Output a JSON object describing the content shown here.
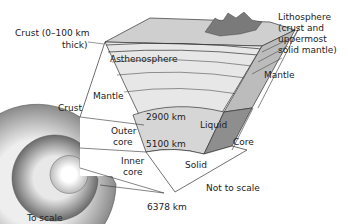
{
  "diagram": {
    "labels": {
      "crust_thick_1": "Crust (0–100 km",
      "crust_thick_2": "thick)",
      "asthenosphere": "Asthenosphere",
      "lithosphere_1": "Lithosphere",
      "lithosphere_2": "(crust and",
      "lithosphere_3": "uppermost",
      "lithosphere_4": "solid mantle)",
      "mantle_right": "Mantle",
      "mantle_left": "Mantle",
      "crust_left": "Crust",
      "depth_2900": "2900 km",
      "depth_5100": "5100 km",
      "depth_6378": "6378 km",
      "outer_core_1": "Outer",
      "outer_core_2": "core",
      "inner_core_1": "Inner",
      "inner_core_2": "core",
      "liquid": "Liquid",
      "solid": "Solid",
      "core": "Core",
      "not_to_scale": "Not to scale",
      "to_scale": "To scale"
    },
    "colors": {
      "mantle_light": "#e6e6e6",
      "mantle_mid": "#d2d2d2",
      "outer_core": "#d8d8d8",
      "liquid_side": "#8e8e8e",
      "side_face": "#bdbdbd",
      "top_face": "#c8c8c8",
      "mountain": "#7a7a7a",
      "stroke": "#333333"
    }
  }
}
